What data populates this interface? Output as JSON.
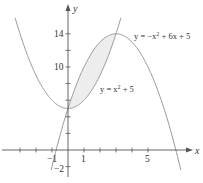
{
  "figure": {
    "type": "function-graph",
    "axes": {
      "x_label": "x",
      "y_label": "y",
      "x_tick_labels": [
        {
          "value": -1,
          "text": "−1"
        },
        {
          "value": 1,
          "text": "1"
        },
        {
          "value": 5,
          "text": "5"
        }
      ],
      "y_tick_labels": [
        {
          "value": 14,
          "text": "14"
        },
        {
          "value": 10,
          "text": "10"
        },
        {
          "value": -2,
          "text": "−2"
        }
      ],
      "x_ticks": [
        -3,
        -2,
        -1,
        1,
        2,
        3,
        4,
        5
      ],
      "y_ticks": [
        2,
        4,
        6,
        8,
        10,
        12,
        14,
        -2
      ],
      "x_range": [
        -4.2,
        7.8
      ],
      "y_range": [
        -3.2,
        17.5
      ]
    },
    "curves": [
      {
        "name": "upper-parabola",
        "equation": "y = x² + 5",
        "label_main": "y = x",
        "label_sup": "2",
        "label_tail": " + 5",
        "x_range": [
          -3.3,
          3.3
        ]
      },
      {
        "name": "lower-parabola",
        "equation": "y = −x² + 6x + 5",
        "label_main": "y = −x",
        "label_sup": "2",
        "label_tail": " + 6x + 5",
        "x_range": [
          -1.05,
          7.05
        ]
      }
    ],
    "shaded_region": {
      "between": [
        "y = −x² + 6x + 5",
        "y = x² + 5"
      ],
      "x_from": 0,
      "x_to": 3
    },
    "colors": {
      "curve": "#9a9a9a",
      "axis": "#555555",
      "shade": "#ededed",
      "text": "#333333"
    }
  }
}
